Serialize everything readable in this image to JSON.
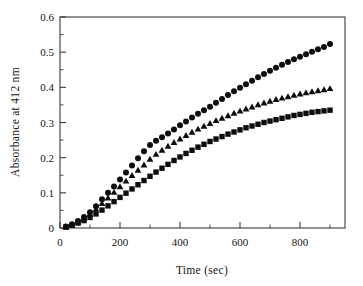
{
  "chart_data": {
    "type": "scatter",
    "title": "",
    "xlabel": "Time (sec)",
    "ylabel": "Absorbance at 412 nm",
    "xlim": [
      0,
      950
    ],
    "ylim": [
      0,
      0.6
    ],
    "xticks": [
      0,
      200,
      400,
      600,
      800
    ],
    "xtick_labels": [
      "0",
      "200",
      "400",
      "600",
      "800"
    ],
    "xminor_step": 100,
    "yticks": [
      0,
      0.1,
      0.2,
      0.3,
      0.4,
      0.5,
      0.6
    ],
    "ytick_labels": [
      "0",
      "0.1",
      "0.2",
      "0.3",
      "0.4",
      "0.5",
      "0.6"
    ],
    "yminor_step": 0.05,
    "grid": false,
    "legend": "none",
    "marker_color": "#0d0d0d",
    "frame_color": "#3a3a3a",
    "background_color": "#ffffff",
    "series": [
      {
        "name": "circles",
        "marker": "circle",
        "x": [
          20,
          40,
          60,
          80,
          100,
          120,
          140,
          160,
          180,
          200,
          220,
          240,
          260,
          280,
          300,
          320,
          340,
          360,
          380,
          400,
          420,
          440,
          460,
          480,
          500,
          520,
          540,
          560,
          580,
          600,
          620,
          640,
          660,
          680,
          700,
          720,
          740,
          760,
          780,
          800,
          820,
          840,
          860,
          880,
          900
        ],
        "y": [
          0.004,
          0.011,
          0.02,
          0.031,
          0.045,
          0.062,
          0.082,
          0.1,
          0.118,
          0.138,
          0.158,
          0.178,
          0.198,
          0.218,
          0.236,
          0.248,
          0.258,
          0.269,
          0.28,
          0.292,
          0.303,
          0.314,
          0.325,
          0.335,
          0.345,
          0.356,
          0.367,
          0.378,
          0.389,
          0.399,
          0.409,
          0.419,
          0.429,
          0.438,
          0.447,
          0.456,
          0.464,
          0.472,
          0.48,
          0.487,
          0.494,
          0.501,
          0.508,
          0.515,
          0.523
        ]
      },
      {
        "name": "triangles",
        "marker": "triangle",
        "x": [
          20,
          40,
          60,
          80,
          100,
          120,
          140,
          160,
          180,
          200,
          220,
          240,
          260,
          280,
          300,
          320,
          340,
          360,
          380,
          400,
          420,
          440,
          460,
          480,
          500,
          520,
          540,
          560,
          580,
          600,
          620,
          640,
          660,
          680,
          700,
          720,
          740,
          760,
          780,
          800,
          820,
          840,
          860,
          880,
          900
        ],
        "y": [
          0.003,
          0.009,
          0.017,
          0.027,
          0.04,
          0.054,
          0.07,
          0.086,
          0.102,
          0.118,
          0.134,
          0.15,
          0.165,
          0.18,
          0.196,
          0.21,
          0.222,
          0.233,
          0.244,
          0.254,
          0.264,
          0.273,
          0.282,
          0.29,
          0.298,
          0.306,
          0.313,
          0.32,
          0.327,
          0.333,
          0.339,
          0.345,
          0.351,
          0.356,
          0.361,
          0.366,
          0.37,
          0.374,
          0.378,
          0.382,
          0.385,
          0.388,
          0.391,
          0.394,
          0.397
        ]
      },
      {
        "name": "squares",
        "marker": "square",
        "x": [
          20,
          40,
          60,
          80,
          100,
          120,
          140,
          160,
          180,
          200,
          220,
          240,
          260,
          280,
          300,
          320,
          340,
          360,
          380,
          400,
          420,
          440,
          460,
          480,
          500,
          520,
          540,
          560,
          580,
          600,
          620,
          640,
          660,
          680,
          700,
          720,
          740,
          760,
          780,
          800,
          820,
          840,
          860,
          880,
          900
        ],
        "y": [
          0.003,
          0.008,
          0.014,
          0.021,
          0.03,
          0.04,
          0.051,
          0.063,
          0.075,
          0.087,
          0.099,
          0.111,
          0.123,
          0.135,
          0.147,
          0.159,
          0.17,
          0.181,
          0.192,
          0.202,
          0.212,
          0.221,
          0.23,
          0.238,
          0.246,
          0.253,
          0.26,
          0.267,
          0.273,
          0.279,
          0.285,
          0.29,
          0.295,
          0.3,
          0.304,
          0.308,
          0.312,
          0.316,
          0.32,
          0.323,
          0.326,
          0.329,
          0.331,
          0.333,
          0.335
        ]
      }
    ]
  }
}
